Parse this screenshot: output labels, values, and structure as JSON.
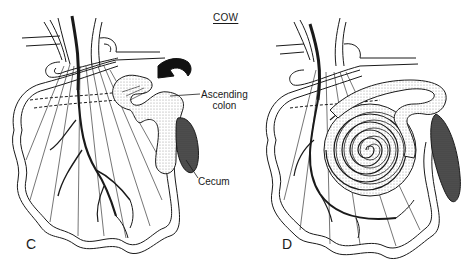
{
  "figure": {
    "title": "COW",
    "panels": [
      {
        "id": "C",
        "label": "C",
        "annotations": [
          {
            "text_line1": "Ascending",
            "text_line2": "colon"
          },
          {
            "text": "Cecum"
          }
        ]
      },
      {
        "id": "D",
        "label": "D"
      }
    ],
    "colors": {
      "line": "#1a1a1a",
      "stipple": "#d9d9d9",
      "cecum": "#4a4a4a",
      "background": "#ffffff"
    }
  }
}
